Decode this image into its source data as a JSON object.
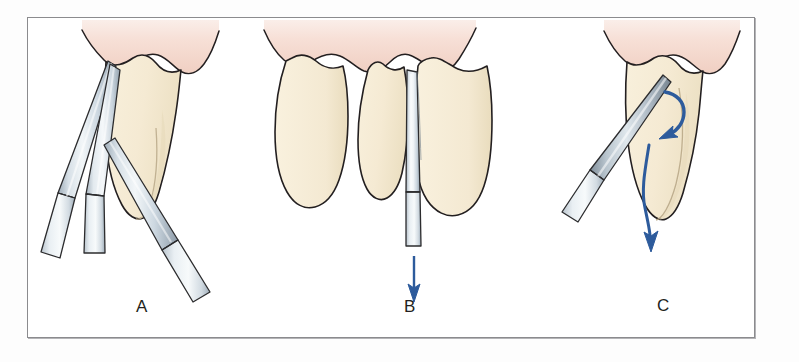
{
  "figure": {
    "frame": {
      "border_color": "#8b8b8e",
      "background_color": "#ffffff"
    },
    "palette": {
      "gingiva_top": "#f7e2da",
      "gingiva_bottom": "#f1d2c6",
      "tooth_fill": "#f6ecd6",
      "tooth_shadow": "#eadfc2",
      "outline": "#231f20",
      "instrument_light": "#eef2f5",
      "instrument_mid": "#c3ced8",
      "instrument_dark": "#8e9ca8",
      "arrow_blue": "#2d5b9c",
      "label_color": "#231f20"
    },
    "panels": [
      {
        "id": "panel-a",
        "label": "A",
        "caption_position": "bottom-center",
        "instrument_count": 3,
        "tooth_count": 1,
        "arrow_count": 0,
        "content": "Three elevators wedged along the mesial aspect of a single-rooted tooth below the gingival margin"
      },
      {
        "id": "panel-b",
        "label": "B",
        "caption_position": "bottom-center",
        "instrument_count": 1,
        "tooth_count": 3,
        "arrow_count": 1,
        "arrow_direction": "down",
        "content": "A straight elevator inserted into the interproximal space between adjacent teeth, directed apically"
      },
      {
        "id": "panel-c",
        "label": "C",
        "caption_position": "bottom-center",
        "instrument_count": 1,
        "tooth_count": 1,
        "arrow_count": 2,
        "arrow_direction": "curved rotational and downward",
        "content": "Elevator engaged against the tooth root with curved arrows showing rotational luxation and apical force"
      }
    ],
    "labels": {
      "a": "A",
      "b": "B",
      "c": "C"
    }
  }
}
